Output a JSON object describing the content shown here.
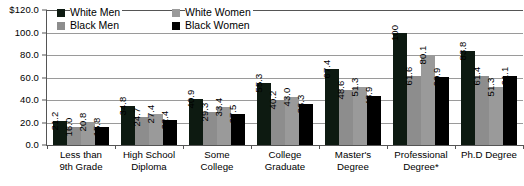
{
  "chart_data": {
    "type": "bar",
    "title": "",
    "xlabel": "",
    "ylabel": "",
    "ylim": [
      0,
      120
    ],
    "grid": true,
    "legend_position": "top-inside",
    "categories": [
      "Less than 9th Grade",
      "High School Diploma",
      "Some College",
      "College Graduate",
      "Master's Degree",
      "Professional Degree*",
      "Ph.D Degree"
    ],
    "category_lines": [
      [
        "Less than",
        "9th Grade"
      ],
      [
        "High School",
        "Diploma"
      ],
      [
        "Some",
        "College"
      ],
      [
        "College",
        "Graduate"
      ],
      [
        "Master's",
        "Degree"
      ],
      [
        "Professional",
        "Degree*"
      ],
      [
        "Ph.D Degree",
        ""
      ]
    ],
    "series": [
      {
        "name": "White Men",
        "color": "#0d1a11",
        "values": [
          21.2,
          34.8,
          40.9,
          55.3,
          67.4,
          100,
          83.8
        ],
        "labels": [
          "21.2",
          "34.8",
          "40.9",
          "55.3",
          "67.4",
          "100",
          "83.8"
        ]
      },
      {
        "name": "Black Men",
        "color": "#8d8d8d",
        "values": [
          16.0,
          24.7,
          29.3,
          40.2,
          48.6,
          61.6,
          61.4
        ],
        "labels": [
          "16.0",
          "24.7",
          "29.3",
          "40.2",
          "48.6",
          "61.6",
          "61.4"
        ]
      },
      {
        "name": "White Women",
        "color": "#9a9a9a",
        "values": [
          20.8,
          27.4,
          33.4,
          43.0,
          51.3,
          80.1,
          51.3
        ],
        "labels": [
          "20.8",
          "27.4",
          "33.4",
          "43.0",
          "51.3",
          "80.1",
          "51.3"
        ]
      },
      {
        "name": "Black Women",
        "color": "#000000",
        "values": [
          15.8,
          22.4,
          27.5,
          36.3,
          43.9,
          60.9,
          61.1
        ],
        "labels": [
          "15.8",
          "22.4",
          "27.5",
          "36.3",
          "43.9",
          "60.9",
          "61.1"
        ]
      }
    ],
    "yticks": [
      "$120.0",
      "100.0",
      "80.0",
      "60.0",
      "40.0",
      "20.0",
      "0.0"
    ],
    "ytick_values": [
      120,
      100,
      80,
      60,
      40,
      20,
      0
    ]
  },
  "legend": {
    "items": [
      {
        "label": "White Men",
        "color": "#0d1a11"
      },
      {
        "label": "White Women",
        "color": "#9a9a9a"
      },
      {
        "label": "Black Men",
        "color": "#8d8d8d"
      },
      {
        "label": "Black Women",
        "color": "#000000"
      }
    ]
  }
}
